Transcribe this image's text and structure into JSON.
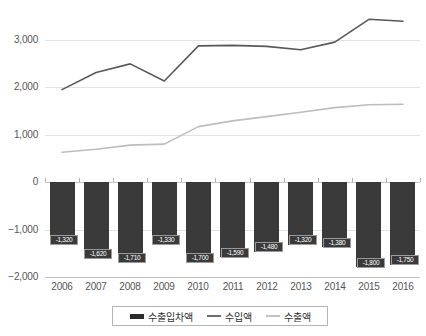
{
  "chart_data": {
    "type": "bar",
    "title": "",
    "xlabel": "",
    "ylabel": "",
    "ylim": [
      -2000,
      3500
    ],
    "yticks": [
      3000,
      2000,
      1000,
      0,
      -1000,
      -2000
    ],
    "ytick_labels": [
      "3,000",
      "2,000",
      "1,000",
      "0",
      "−1,000",
      "−2,000"
    ],
    "categories": [
      "2006",
      "2007",
      "2008",
      "2009",
      "2010",
      "2011",
      "2012",
      "2013",
      "2014",
      "2015",
      "2016"
    ],
    "grid": true,
    "legend_position": "bottom",
    "series": [
      {
        "name": "수출입차액",
        "type": "bar",
        "color": "#3a3a3a",
        "values": [
          -1320,
          -1620,
          -1710,
          -1330,
          -1700,
          -1590,
          -1480,
          -1320,
          -1380,
          -1800,
          -1750
        ],
        "labels": [
          "-1,320",
          "-1,620",
          "-1,710",
          "-1,330",
          "-1,700",
          "-1,590",
          "-1,480",
          "-1,320",
          "-1,380",
          "-1,800",
          "-1,750"
        ]
      },
      {
        "name": "수입액",
        "type": "line",
        "color": "#595959",
        "values": [
          1950,
          2310,
          2490,
          2130,
          2870,
          2880,
          2860,
          2790,
          2950,
          3430,
          3390
        ]
      },
      {
        "name": "수출액",
        "type": "line",
        "color": "#bdbdbd",
        "values": [
          630,
          690,
          780,
          800,
          1170,
          1290,
          1380,
          1470,
          1570,
          1630,
          1640
        ]
      }
    ]
  },
  "legend": {
    "items": [
      {
        "label": "수출입차액",
        "marker": "bar",
        "color": "#2b2b2b"
      },
      {
        "label": "수입액",
        "marker": "line",
        "color": "#6e6e6e"
      },
      {
        "label": "수출액",
        "marker": "line",
        "color": "#c2c2c2"
      }
    ]
  }
}
